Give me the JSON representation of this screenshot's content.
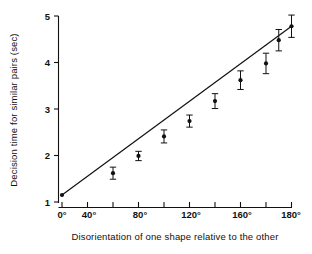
{
  "chart_data": {
    "type": "scatter",
    "title": "",
    "xlabel": "Disorientation of one shape relative to the other",
    "ylabel": "Decision time for similar pairs (sec)",
    "xlim": [
      0,
      180
    ],
    "ylim": [
      1,
      5
    ],
    "grid": false,
    "legend": null,
    "x": [
      0,
      40,
      60,
      80,
      100,
      120,
      140,
      160,
      170,
      180
    ],
    "values": [
      1.15,
      1.62,
      1.99,
      2.41,
      2.74,
      3.17,
      3.62,
      3.98,
      4.48,
      4.78
    ],
    "errors": [
      0.0,
      0.13,
      0.1,
      0.14,
      0.13,
      0.16,
      0.2,
      0.22,
      0.23,
      0.24
    ],
    "xticks": [
      0,
      40,
      80,
      120,
      160,
      180
    ],
    "xticklabels": [
      "0°",
      "40°",
      "80°",
      "120°",
      "160°",
      "180°"
    ],
    "xminorticks": [
      20,
      60,
      100,
      140
    ],
    "yticks": [
      1,
      2,
      3,
      4,
      5
    ],
    "yticklabels": [
      "1",
      "2",
      "3",
      "4",
      "5"
    ],
    "fit_line": {
      "x_start": 0,
      "y_start": 1.15,
      "x_end": 180,
      "y_end": 4.78
    },
    "marker_color": "#111111",
    "line_color": "#111111"
  },
  "axes": {
    "y_title": "Decision time for similar pairs (sec)",
    "x_title": "Disorientation of one shape relative to the other"
  },
  "yticks": {
    "t0": "1",
    "t1": "2",
    "t2": "3",
    "t3": "4",
    "t4": "5"
  },
  "xticks": {
    "t0": "0°",
    "t1": "40°",
    "t2": "80°",
    "t3": "120°",
    "t4": "160°",
    "t5": "180°"
  }
}
